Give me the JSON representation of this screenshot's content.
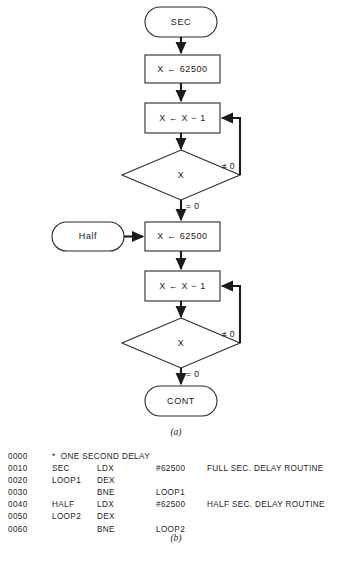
{
  "figure": {
    "caption_a": "(a)",
    "caption_b": "(b)"
  },
  "flowchart": {
    "nodes": {
      "start_terminal": "SEC",
      "init_full": "X ← 62500",
      "dec_full": "X ← X − 1",
      "test_full": "X",
      "half_terminal": "Half",
      "init_half": "X ← 62500",
      "dec_half": "X ← X − 1",
      "test_half": "X",
      "end_terminal": "CONT"
    },
    "edge_labels": {
      "full_nonzero": "≠ 0",
      "full_zero": "= 0",
      "half_nonzero": "≠ 0",
      "half_zero": "= 0"
    }
  },
  "listing": {
    "columns": [
      "line",
      "label",
      "mnemonic",
      "operand",
      "comment"
    ],
    "rows": [
      {
        "line": "0000",
        "label": "",
        "mnemonic": "",
        "operand": "",
        "comment": "",
        "full": "*  ONE SECOND DELAY"
      },
      {
        "line": "0010",
        "label": "SEC",
        "mnemonic": "LDX",
        "operand": "#62500",
        "comment": "FULL SEC. DELAY ROUTINE",
        "full": ""
      },
      {
        "line": "0020",
        "label": "LOOP1",
        "mnemonic": "DEX",
        "operand": "",
        "comment": "",
        "full": ""
      },
      {
        "line": "0030",
        "label": "",
        "mnemonic": "BNE",
        "operand": "LOOP1",
        "comment": "",
        "full": ""
      },
      {
        "line": "0040",
        "label": "HALF",
        "mnemonic": "LDX",
        "operand": "#62500",
        "comment": "HALF SEC. DELAY ROUTINE",
        "full": ""
      },
      {
        "line": "0050",
        "label": "LOOP2",
        "mnemonic": "DEX",
        "operand": "",
        "comment": "",
        "full": ""
      },
      {
        "line": "0060",
        "label": "",
        "mnemonic": "BNE",
        "operand": "LOOP2",
        "comment": "",
        "full": ""
      }
    ]
  },
  "colors": {
    "background": "#ffffff",
    "stroke": "#2b2b2b",
    "connector": "#1b1b1b",
    "text": "#1a1a1a"
  }
}
